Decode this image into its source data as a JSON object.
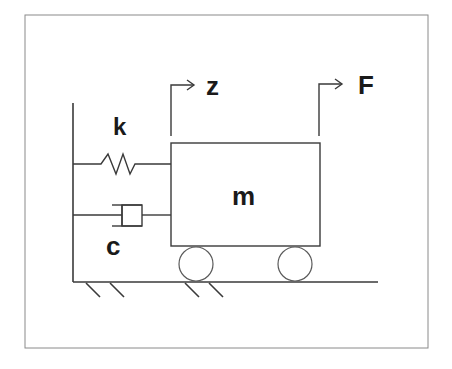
{
  "diagram": {
    "title": "",
    "type": "mass-spring-damper system",
    "labels": {
      "spring": "k",
      "damper": "c",
      "mass": "m",
      "displacement": "z",
      "force": "F"
    },
    "colors": {
      "line": "#3a3a3a",
      "text": "#1a1a1a",
      "frame": "#8a8a8a",
      "background": "#ffffff"
    },
    "components": [
      {
        "id": "wall",
        "kind": "fixed support"
      },
      {
        "id": "spring",
        "kind": "spring",
        "label": "k"
      },
      {
        "id": "damper",
        "kind": "dashpot",
        "label": "c"
      },
      {
        "id": "mass",
        "kind": "block on wheels",
        "label": "m"
      },
      {
        "id": "displacement-arrow",
        "kind": "arrow",
        "label": "z"
      },
      {
        "id": "force-arrow",
        "kind": "arrow",
        "label": "F"
      },
      {
        "id": "ground",
        "kind": "ground with hatching"
      }
    ]
  }
}
